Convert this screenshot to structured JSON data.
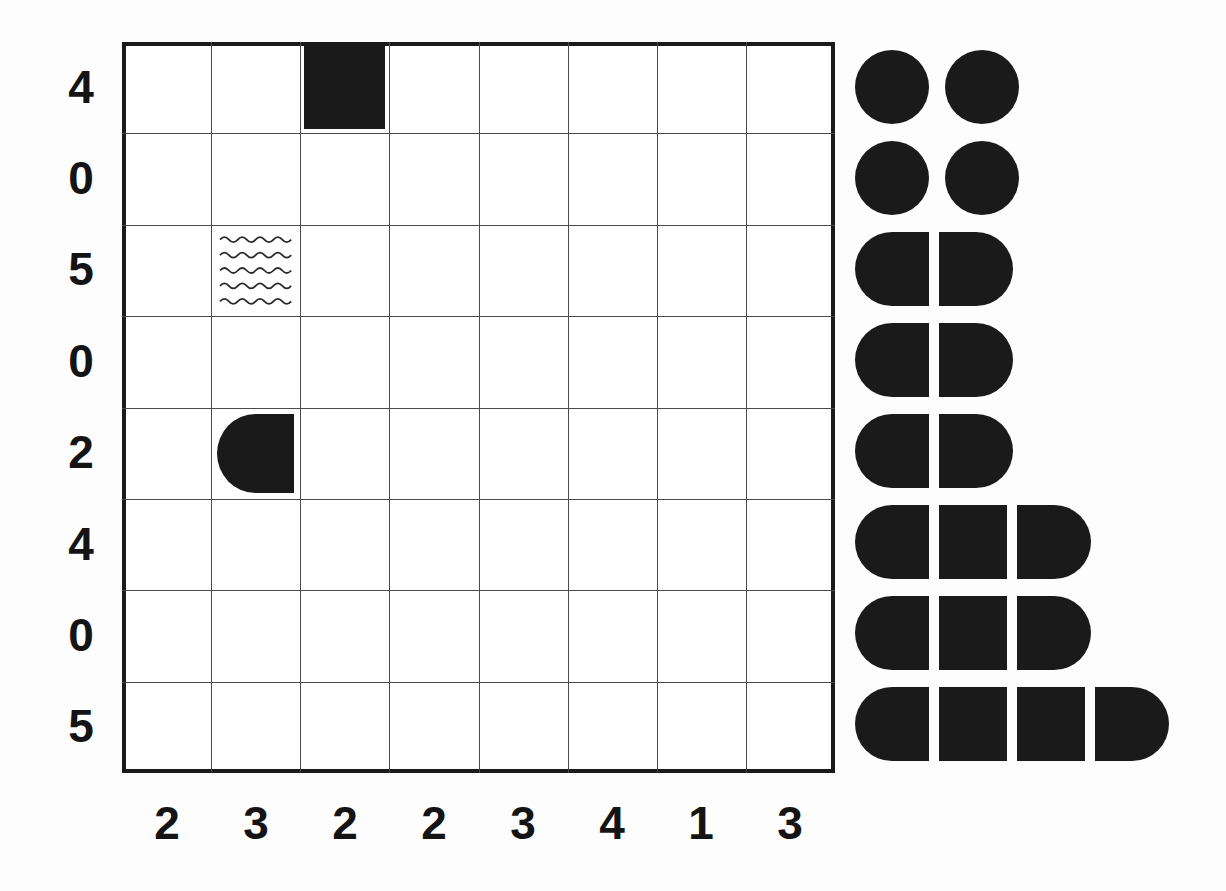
{
  "page": {
    "background_color": "#fdfdfd",
    "ink_color": "#1a1a1a",
    "gridline_color": "#4a4a4a"
  },
  "grid": {
    "columns": 8,
    "rows": 8,
    "row_labels": [
      "4",
      "0",
      "5",
      "0",
      "2",
      "4",
      "0",
      "5"
    ],
    "column_labels": [
      "2",
      "3",
      "2",
      "2",
      "3",
      "4",
      "1",
      "3"
    ],
    "cells": [
      {
        "name": "filled-square-cell",
        "row": 1,
        "column": 3,
        "shape": "filled-square",
        "fill": "#1a1a1a"
      },
      {
        "name": "wave-pattern-cell",
        "row": 3,
        "column": 2,
        "shape": "wavy-lines",
        "wave_count": 5,
        "fill": "none"
      },
      {
        "name": "half-round-cell",
        "row": 5,
        "column": 2,
        "shape": "d-shape-left-rounded",
        "fill": "#1a1a1a"
      }
    ]
  },
  "shape_cluster": {
    "name": "pill-segment-stack",
    "rows": [
      {
        "index": 1,
        "segments": [
          "circle",
          "circle"
        ]
      },
      {
        "index": 2,
        "segments": [
          "circle",
          "circle"
        ]
      },
      {
        "index": 3,
        "segments": [
          "left-cap",
          "right-cap"
        ]
      },
      {
        "index": 4,
        "segments": [
          "left-cap",
          "right-cap"
        ]
      },
      {
        "index": 5,
        "segments": [
          "left-cap",
          "right-cap"
        ]
      },
      {
        "index": 6,
        "segments": [
          "left-cap",
          "middle",
          "right-cap"
        ]
      },
      {
        "index": 7,
        "segments": [
          "left-cap",
          "middle",
          "right-cap"
        ]
      },
      {
        "index": 8,
        "segments": [
          "left-cap",
          "middle",
          "middle",
          "right-cap"
        ]
      }
    ]
  },
  "chart_data": {
    "type": "table",
    "xlabel": "",
    "ylabel": "",
    "grid": true,
    "categories": [
      "2",
      "3",
      "2",
      "2",
      "3",
      "4",
      "1",
      "3"
    ],
    "row_categories": [
      "4",
      "0",
      "5",
      "0",
      "2",
      "4",
      "0",
      "5"
    ],
    "marked_cells": [
      {
        "row": 1,
        "column": 3,
        "marker": "filled-square"
      },
      {
        "row": 3,
        "column": 2,
        "marker": "wavy-lines"
      },
      {
        "row": 5,
        "column": 2,
        "marker": "d-shape-left-rounded"
      }
    ],
    "legend_counts": [
      2,
      2,
      2,
      2,
      2,
      3,
      3,
      4
    ]
  }
}
